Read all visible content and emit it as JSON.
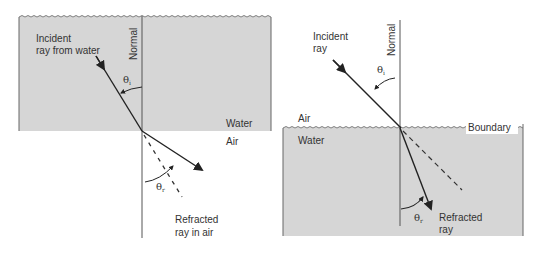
{
  "colors": {
    "water": "#d6d6d6",
    "line": "#444444",
    "ray": "#222222",
    "text": "#333333",
    "background": "#ffffff"
  },
  "panels": [
    {
      "id": "water-to-air",
      "labels": {
        "incident_line1": "Incident",
        "incident_line2": "ray from water",
        "normal": "Normal",
        "theta_i": "θ",
        "theta_i_sub": "i",
        "medium_top": "Water",
        "medium_bottom": "Air",
        "theta_r": "θ",
        "theta_r_sub": "r",
        "refracted_line1": "Refracted",
        "refracted_line2": "ray in air"
      }
    },
    {
      "id": "air-to-water",
      "labels": {
        "incident_line1": "Incident",
        "incident_line2": "ray",
        "normal": "Normal",
        "theta_i": "θ",
        "theta_i_sub": "i",
        "medium_top": "Air",
        "medium_bottom": "Water",
        "boundary": "Boundary",
        "theta_r": "θ",
        "theta_r_sub": "r",
        "refracted_line1": "Refracted",
        "refracted_line2": "ray"
      }
    }
  ]
}
